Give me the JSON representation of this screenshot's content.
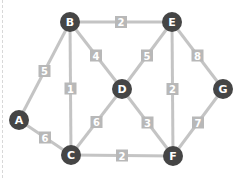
{
  "graph": {
    "nodes": [
      {
        "id": "A",
        "x": 19,
        "y": 120
      },
      {
        "id": "B",
        "x": 70,
        "y": 22
      },
      {
        "id": "C",
        "x": 71,
        "y": 155
      },
      {
        "id": "D",
        "x": 122,
        "y": 89
      },
      {
        "id": "E",
        "x": 172,
        "y": 22
      },
      {
        "id": "F",
        "x": 173,
        "y": 156
      },
      {
        "id": "G",
        "x": 223,
        "y": 89
      }
    ],
    "edges": [
      {
        "from": "A",
        "to": "B",
        "weight": "5"
      },
      {
        "from": "A",
        "to": "C",
        "weight": "6"
      },
      {
        "from": "B",
        "to": "C",
        "weight": "1"
      },
      {
        "from": "B",
        "to": "D",
        "weight": "4"
      },
      {
        "from": "B",
        "to": "E",
        "weight": "2"
      },
      {
        "from": "C",
        "to": "D",
        "weight": "6"
      },
      {
        "from": "C",
        "to": "F",
        "weight": "2"
      },
      {
        "from": "D",
        "to": "E",
        "weight": "5"
      },
      {
        "from": "D",
        "to": "F",
        "weight": "3"
      },
      {
        "from": "E",
        "to": "F",
        "weight": "2"
      },
      {
        "from": "E",
        "to": "G",
        "weight": "8"
      },
      {
        "from": "F",
        "to": "G",
        "weight": "7"
      }
    ]
  },
  "colors": {
    "node_fill": "#454545",
    "node_text": "#ffffff",
    "edge": "#c4c4c4",
    "weight_bg": "#b8b8b8",
    "weight_text": "#ffffff"
  }
}
